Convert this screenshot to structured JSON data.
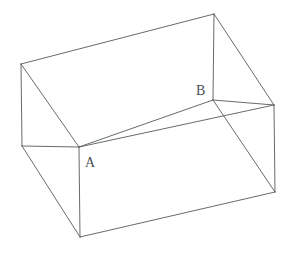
{
  "figure": {
    "type": "line-drawing",
    "background_color": "#ffffff",
    "stroke_color": "#555a5e",
    "stroke_width": 0.9,
    "label_color": "#4a4f53",
    "labels": [
      {
        "id": "A",
        "text": "A",
        "x": 85,
        "y": 156,
        "anchor_vertex": "inner-front-left"
      },
      {
        "id": "B",
        "text": "B",
        "x": 196,
        "y": 84,
        "anchor_vertex": "inner-front-right"
      }
    ],
    "vertices": {
      "top_back_left": [
        21,
        64
      ],
      "top_back_right": [
        214,
        14
      ],
      "inner_front_left": [
        79,
        147
      ],
      "inner_front_right": [
        213,
        100
      ],
      "outer_left": [
        22,
        146
      ],
      "outer_right": [
        274,
        105
      ],
      "bottom_front_left": [
        80,
        237
      ],
      "bottom_right": [
        275,
        192
      ],
      "inner_back_left": [
        80,
        122
      ],
      "inner_back_right": [
        275,
        115
      ]
    },
    "edges": [
      {
        "name": "top-back-edge",
        "from": "top_back_left",
        "to": "top_back_right"
      },
      {
        "name": "left-rim-edge",
        "from": "top_back_left",
        "to": "outer_left"
      },
      {
        "name": "left-inner-wall-edge",
        "from": "top_back_left",
        "to": "inner_front_left"
      },
      {
        "name": "inner-floor-front-edge",
        "from": "inner_front_left",
        "to": "inner_front_right"
      },
      {
        "name": "right-inner-wall-edge",
        "from": "top_back_right",
        "to": "inner_front_right"
      },
      {
        "name": "right-rim-edge",
        "from": "top_back_right",
        "to": "outer_right"
      },
      {
        "name": "front-rim-edge",
        "from": "outer_left",
        "to": "inner_front_left"
      },
      {
        "name": "rim-far-edge",
        "from": "inner_front_left",
        "to": "outer_right"
      },
      {
        "name": "front-left-vertical",
        "from": "outer_left",
        "to": "bottom_front_left"
      },
      {
        "name": "front-corner-vertical",
        "from": "inner_front_left",
        "to": "bottom_front_left"
      },
      {
        "name": "bottom-front-edge",
        "from": "bottom_front_left",
        "to": "bottom_right"
      },
      {
        "name": "right-vertical",
        "from": "outer_right",
        "to": "bottom_right"
      },
      {
        "name": "right-face-diagonal",
        "from": "inner_front_right",
        "to": "bottom_right"
      },
      {
        "name": "inner-front-vertical",
        "from": "inner_front_right",
        "to": "outer_right"
      }
    ]
  }
}
